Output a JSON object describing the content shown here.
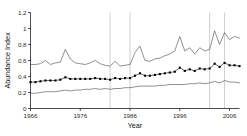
{
  "chart_data": {
    "type": "line",
    "title": "",
    "xlabel": "Year",
    "ylabel": "Abundance Index",
    "xlim": [
      1966,
      2008
    ],
    "ylim": [
      0,
      1.2
    ],
    "grid": false,
    "legend": "none",
    "x_ticks": [
      1966,
      1976,
      1986,
      1996,
      2006
    ],
    "x_tick_labels": [
      "1966",
      "1976",
      "1986",
      "1996",
      "2006"
    ],
    "y_ticks": [
      0,
      0.2,
      0.4,
      0.6,
      0.8,
      1,
      1.2
    ],
    "y_tick_labels": [
      "0",
      "0.2",
      "0.4",
      "0.6",
      "0.8",
      "1",
      "1.2"
    ],
    "reference_lines": {
      "orientation": "vertical",
      "color": "#b9b9b9",
      "x_values": [
        1982,
        1986,
        2002,
        2005
      ]
    },
    "x": [
      1966,
      1967,
      1968,
      1969,
      1970,
      1971,
      1972,
      1973,
      1974,
      1975,
      1976,
      1977,
      1978,
      1979,
      1980,
      1981,
      1982,
      1983,
      1984,
      1985,
      1986,
      1987,
      1988,
      1989,
      1990,
      1991,
      1992,
      1993,
      1994,
      1995,
      1996,
      1997,
      1998,
      1999,
      2000,
      2001,
      2002,
      2003,
      2004,
      2005,
      2006,
      2007,
      2008
    ],
    "series": [
      {
        "name": "Upper confidence limit",
        "style": "line",
        "color": "#555555",
        "markers": false,
        "values": [
          0.55,
          0.55,
          0.56,
          0.6,
          0.55,
          0.57,
          0.58,
          0.74,
          0.62,
          0.57,
          0.56,
          0.55,
          0.57,
          0.6,
          0.56,
          0.54,
          0.53,
          0.59,
          0.53,
          0.54,
          0.55,
          0.7,
          0.78,
          0.6,
          0.59,
          0.62,
          0.63,
          0.66,
          0.68,
          0.72,
          0.9,
          0.72,
          0.76,
          0.68,
          0.76,
          0.72,
          0.74,
          0.97,
          0.8,
          0.95,
          0.86,
          0.9,
          0.88
        ]
      },
      {
        "name": "Abundance index (point estimate)",
        "style": "line-marker",
        "color": "#000000",
        "markers": true,
        "marker_shape": "square",
        "values": [
          0.33,
          0.33,
          0.34,
          0.35,
          0.35,
          0.35,
          0.36,
          0.39,
          0.37,
          0.37,
          0.37,
          0.37,
          0.37,
          0.38,
          0.37,
          0.37,
          0.36,
          0.38,
          0.37,
          0.38,
          0.38,
          0.41,
          0.44,
          0.41,
          0.41,
          0.42,
          0.43,
          0.44,
          0.45,
          0.46,
          0.51,
          0.47,
          0.49,
          0.47,
          0.5,
          0.49,
          0.5,
          0.56,
          0.52,
          0.57,
          0.54,
          0.54,
          0.53
        ]
      },
      {
        "name": "Lower confidence limit",
        "style": "line",
        "color": "#555555",
        "markers": false,
        "values": [
          0.19,
          0.19,
          0.2,
          0.21,
          0.21,
          0.21,
          0.22,
          0.23,
          0.22,
          0.23,
          0.23,
          0.24,
          0.24,
          0.25,
          0.24,
          0.25,
          0.24,
          0.25,
          0.25,
          0.26,
          0.26,
          0.27,
          0.28,
          0.28,
          0.28,
          0.28,
          0.29,
          0.29,
          0.3,
          0.3,
          0.3,
          0.3,
          0.31,
          0.31,
          0.32,
          0.31,
          0.32,
          0.34,
          0.32,
          0.35,
          0.33,
          0.33,
          0.32
        ]
      }
    ]
  }
}
